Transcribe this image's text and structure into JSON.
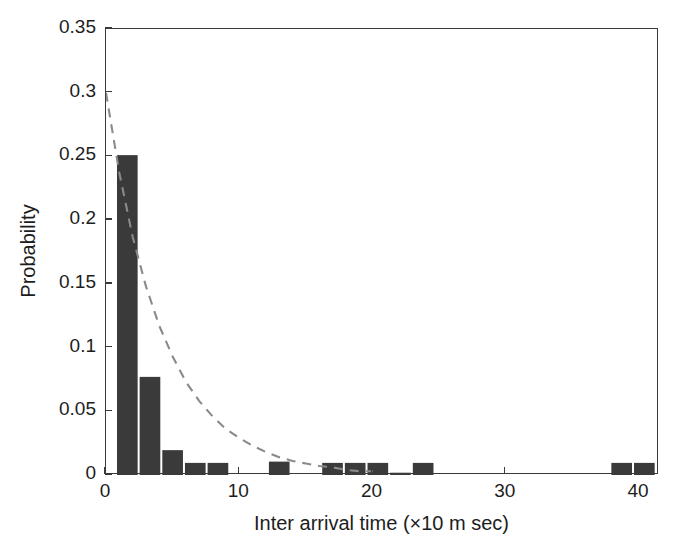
{
  "chart_data": {
    "type": "bar",
    "title": "",
    "subtitle": "",
    "xlabel": "Inter arrival time (×10 m sec)",
    "ylabel": "Probability",
    "xlim": [
      0,
      41.5
    ],
    "ylim": [
      0,
      0.35
    ],
    "xticks": [
      0,
      10,
      20,
      30,
      40
    ],
    "xticklabels": [
      "0",
      "10",
      "20",
      "30",
      "40"
    ],
    "yticks": [
      0,
      0.05,
      0.1,
      0.15,
      0.2,
      0.25,
      0.3,
      0.35
    ],
    "yticklabels": [
      "0",
      "0.05",
      "0.1",
      "0.15",
      "0.2",
      "0.25",
      "0.3",
      "0.35"
    ],
    "grid": false,
    "legend": null,
    "bar_color": "#3a3a3a",
    "bar_width": 1.55,
    "bins": [
      {
        "x": 1.6,
        "value": 0.251
      },
      {
        "x": 3.3,
        "value": 0.077
      },
      {
        "x": 5.0,
        "value": 0.0195
      },
      {
        "x": 6.7,
        "value": 0.0095
      },
      {
        "x": 8.4,
        "value": 0.0095
      },
      {
        "x": 13.0,
        "value": 0.0105
      },
      {
        "x": 17.0,
        "value": 0.0095
      },
      {
        "x": 18.7,
        "value": 0.0095
      },
      {
        "x": 20.4,
        "value": 0.0095
      },
      {
        "x": 22.1,
        "value": 0.0018
      },
      {
        "x": 23.8,
        "value": 0.0095
      },
      {
        "x": 38.7,
        "value": 0.0095
      },
      {
        "x": 40.4,
        "value": 0.0095
      }
    ],
    "fit_curve": {
      "style": "dashed",
      "color": "#8a8a8a",
      "description": "exponential decay fit",
      "amplitude": 0.3,
      "decay_rate": 0.235,
      "points": [
        {
          "x": 0.0,
          "y": 0.3
        },
        {
          "x": 1.0,
          "y": 0.237
        },
        {
          "x": 2.0,
          "y": 0.187
        },
        {
          "x": 3.0,
          "y": 0.148
        },
        {
          "x": 4.0,
          "y": 0.117
        },
        {
          "x": 5.0,
          "y": 0.093
        },
        {
          "x": 6.0,
          "y": 0.073
        },
        {
          "x": 7.0,
          "y": 0.058
        },
        {
          "x": 8.0,
          "y": 0.046
        },
        {
          "x": 9.0,
          "y": 0.036
        },
        {
          "x": 10.0,
          "y": 0.029
        },
        {
          "x": 11.0,
          "y": 0.023
        },
        {
          "x": 12.0,
          "y": 0.018
        },
        {
          "x": 13.0,
          "y": 0.014
        },
        {
          "x": 14.0,
          "y": 0.011
        },
        {
          "x": 15.0,
          "y": 0.009
        },
        {
          "x": 16.0,
          "y": 0.007
        },
        {
          "x": 17.0,
          "y": 0.006
        },
        {
          "x": 18.0,
          "y": 0.004
        },
        {
          "x": 19.0,
          "y": 0.003
        },
        {
          "x": 20.0,
          "y": 0.003
        }
      ]
    }
  },
  "axes": {
    "ylabel_text": "Probability",
    "xlabel_text": "Inter arrival time (×10 m sec)"
  }
}
